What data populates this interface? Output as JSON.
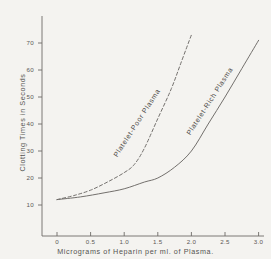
{
  "chart_data": {
    "type": "line",
    "title": "",
    "xlabel": "Micrograms of Heparin per ml. of Plasma.",
    "ylabel": "Clotting Times in Seconds",
    "xlim": [
      -0.25,
      3.35
    ],
    "ylim": [
      0,
      76
    ],
    "xticks": [
      0,
      0.5,
      1.0,
      1.5,
      2.0,
      2.5,
      3.0
    ],
    "xtick_labels": [
      "0",
      "0.5",
      "1.0",
      "1.5",
      "2.0",
      "2.5",
      "3.0"
    ],
    "yticks": [
      10,
      20,
      30,
      40,
      50,
      60,
      70
    ],
    "ytick_labels": [
      "10",
      "20",
      "30",
      "40",
      "50",
      "60",
      "70"
    ],
    "grid": false,
    "legend": "inline-curve-labels",
    "series": [
      {
        "name": "Platelet-Poor Plasma",
        "style": "dashed",
        "color": "#6b6865",
        "x": [
          0.0,
          0.25,
          0.5,
          0.75,
          1.0,
          1.15,
          1.3,
          1.5,
          1.7,
          1.85,
          2.0
        ],
        "y": [
          12.0,
          13.5,
          15.5,
          18.5,
          22.0,
          25.0,
          31.0,
          42.0,
          53.0,
          63.0,
          73.0
        ]
      },
      {
        "name": "Platelet-Rich Plasma",
        "style": "solid",
        "color": "#6b6865",
        "x": [
          0.0,
          0.35,
          0.7,
          1.0,
          1.3,
          1.5,
          1.75,
          2.0,
          2.25,
          2.5,
          2.75,
          3.0
        ],
        "y": [
          12.0,
          13.0,
          14.5,
          16.0,
          18.5,
          20.0,
          24.0,
          30.0,
          40.0,
          50.0,
          60.5,
          71.0
        ]
      }
    ],
    "annotations": [
      {
        "text": "Platelet-Poor Plasma",
        "x": 0.9,
        "y": 30
      },
      {
        "text": "Platelet-Rich Plasma",
        "x": 2.0,
        "y": 38
      }
    ]
  },
  "colors": {
    "background": "#f4f3f0",
    "axis": "#6e6b68",
    "text": "#555350",
    "curve": "#6b6865"
  }
}
